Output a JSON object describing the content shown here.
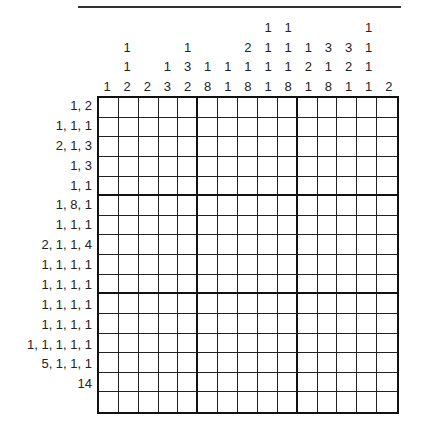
{
  "puzzle": {
    "type": "nonogram",
    "columns": 15,
    "rows": 16,
    "column_clues": [
      [
        1
      ],
      [
        1,
        1,
        2
      ],
      [
        2
      ],
      [
        1,
        3
      ],
      [
        1,
        3,
        2
      ],
      [
        1,
        8
      ],
      [
        1,
        1
      ],
      [
        2,
        1,
        8
      ],
      [
        1,
        1,
        1,
        1
      ],
      [
        1,
        1,
        1,
        8
      ],
      [
        1,
        2,
        1
      ],
      [
        3,
        1,
        8
      ],
      [
        3,
        2,
        1
      ],
      [
        1,
        1,
        1,
        1
      ],
      [
        2
      ]
    ],
    "row_clues": [
      "1, 2",
      "1, 1, 1",
      "2, 1, 3",
      "1, 3",
      "1, 1",
      "1, 8, 1",
      "1, 1, 1",
      "2, 1, 1, 4",
      "1, 1, 1, 1",
      "1, 1, 1, 1",
      "1, 1, 1, 1",
      "1, 1, 1, 1",
      "1, 1, 1, 1, 1",
      "5, 1, 1, 1",
      "14",
      ""
    ],
    "thick_col_after": [
      5,
      10
    ],
    "thick_row_after": [
      5,
      10
    ]
  }
}
